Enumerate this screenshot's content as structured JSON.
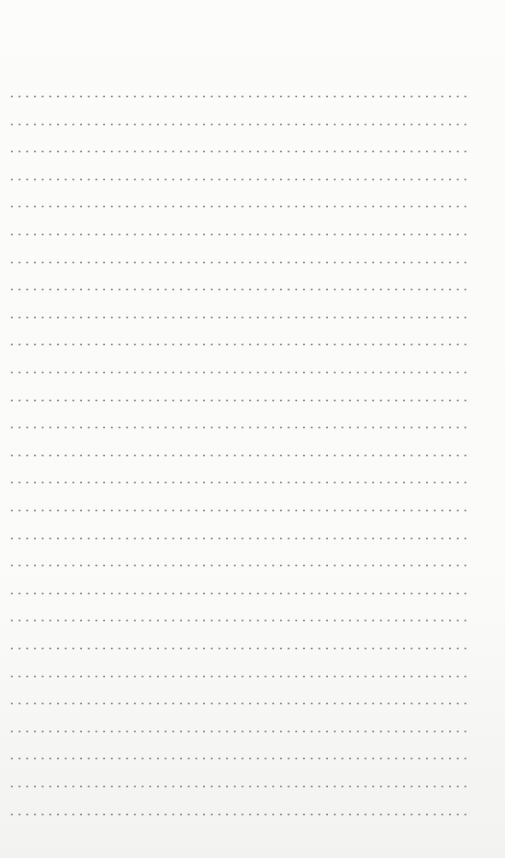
{
  "page": {
    "type": "dotted-lined-notebook-page",
    "line_count": 27,
    "first_line_y": 96,
    "line_spacing": 27.6,
    "line_left": 8,
    "line_width": 462,
    "dot_color": "#8c8c8c",
    "background_color": "#fbfbfa"
  }
}
